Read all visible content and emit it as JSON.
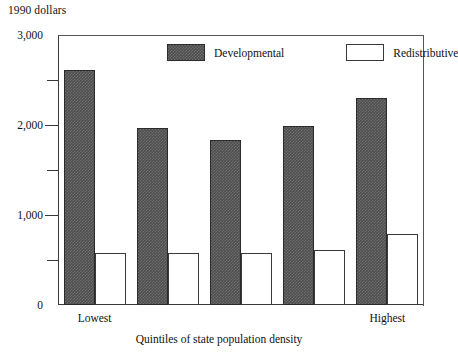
{
  "chart_data": {
    "type": "bar",
    "title": "",
    "unit_label": "1990 dollars",
    "xlabel": "Quintiles of state population density",
    "ylabel": "",
    "categories": [
      "Lowest",
      "",
      "",
      "",
      "Highest"
    ],
    "category_labels_shown": [
      "Lowest",
      "Highest"
    ],
    "series": [
      {
        "name": "Developmental",
        "values": [
          2610,
          1970,
          1830,
          1990,
          2300
        ]
      },
      {
        "name": "Redistributive",
        "values": [
          578,
          575,
          575,
          610,
          790
        ]
      }
    ],
    "ylim": [
      0,
      3000
    ],
    "ytick_labels": [
      "0",
      "1,000",
      "2,000",
      "3,000"
    ],
    "ytick_values": [
      0,
      1000,
      2000,
      3000
    ],
    "yminor_values": [
      500,
      1500,
      2500
    ],
    "grid": false,
    "legend_position": "top-center",
    "colors": {
      "developmental": "#4e4e4e",
      "redistributive": "#ffffff",
      "axis": "#3a3a3a",
      "text": "#111111"
    }
  },
  "legend": {
    "items": [
      {
        "label": "Developmental",
        "swatch": "dark-hatched"
      },
      {
        "label": "Redistributive",
        "swatch": "white-outline"
      }
    ]
  }
}
